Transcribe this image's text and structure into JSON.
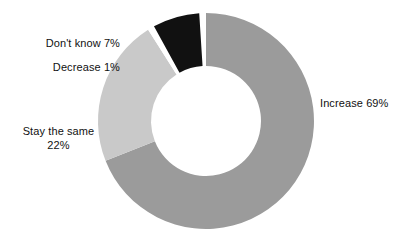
{
  "chart_data": {
    "type": "pie",
    "variant": "donut",
    "title": "",
    "subtitle": "",
    "xlabel": "",
    "ylabel": "",
    "legend_position": "none",
    "grid": false,
    "units": "%",
    "start_angle_deg": 0,
    "direction": "clockwise",
    "center": [
      206,
      121
    ],
    "outer_radius": 108,
    "inner_radius": 55,
    "categories": [
      "Increase",
      "Stay the same",
      "Decrease",
      "Don't know"
    ],
    "values": [
      69,
      22,
      1,
      7
    ],
    "labels": [
      "Increase 69%",
      "Stay the same 22%",
      "Decrease 1%",
      "Don't know 7%"
    ],
    "colors": [
      "#9b9b9b",
      "#c9c9c9",
      "#ffffff",
      "#111111"
    ],
    "slices": [
      {
        "name": "Increase",
        "label": "Increase 69%",
        "value": 69,
        "color": "#9b9b9b",
        "start_deg": 0,
        "end_deg": 248.4
      },
      {
        "name": "Stay the same",
        "label_line1": "Stay the same",
        "label_line2": "22%",
        "label": "Stay the same 22%",
        "value": 22,
        "color": "#c9c9c9",
        "start_deg": 248.4,
        "end_deg": 327.6
      },
      {
        "name": "Decrease",
        "label": "Decrease 1%",
        "value": 1,
        "color": "#ffffff",
        "start_deg": 327.6,
        "end_deg": 331.2
      },
      {
        "name": "Don't know",
        "label": "Don't know 7%",
        "value": 7,
        "color": "#111111",
        "start_deg": 331.2,
        "end_deg": 356.4
      }
    ]
  },
  "labels": {
    "dont_know": "Don't know 7%",
    "decrease": "Decrease 1%",
    "stay_the_same_line1": "Stay the same",
    "stay_the_same_line2": "22%",
    "increase": "Increase 69%"
  },
  "colors": {
    "background": "#ffffff",
    "increase": "#9b9b9b",
    "stay_the_same": "#c9c9c9",
    "decrease": "#ffffff",
    "dont_know": "#111111",
    "text": "#111111"
  }
}
